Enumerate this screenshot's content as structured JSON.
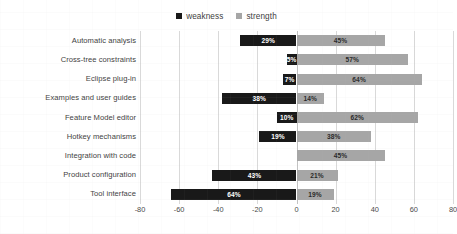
{
  "chart_data": {
    "type": "bar",
    "orientation": "horizontal",
    "subtype": "diverging-bar",
    "title": "",
    "xlabel": "",
    "ylabel": "",
    "xlim": [
      -80,
      80
    ],
    "xticks": [
      "-80",
      "-60",
      "-40",
      "-20",
      "0",
      "20",
      "40",
      "60",
      "80"
    ],
    "xtick_values": [
      -80,
      -60,
      -40,
      -20,
      0,
      20,
      40,
      60,
      80
    ],
    "grid": true,
    "grid_axis": "x",
    "legend_position": "top-center",
    "categories": [
      "Automatic analysis",
      "Cross-tree constraints",
      "Eclipse plug-in",
      "Examples and user guides",
      "Feature Model editor",
      "Hotkey mechanisms",
      "Integration with code",
      "Product configuration",
      "Tool interface"
    ],
    "series": [
      {
        "name": "weakness",
        "color": "#191919",
        "plotted_sign": "negative",
        "values": [
          -29,
          -5,
          -7,
          -38,
          -10,
          -19,
          0,
          -43,
          -64
        ],
        "labels": [
          "29%",
          "5%",
          "7%",
          "38%",
          "10%",
          "19%",
          "",
          "43%",
          "64%"
        ]
      },
      {
        "name": "strength",
        "color": "#a6a6a6",
        "plotted_sign": "positive",
        "values": [
          45,
          57,
          64,
          14,
          62,
          38,
          45,
          21,
          19
        ],
        "labels": [
          "45%",
          "57%",
          "64%",
          "14%",
          "62%",
          "38%",
          "45%",
          "21%",
          "19%"
        ]
      }
    ]
  },
  "legend": {
    "items": [
      {
        "label": "weakness",
        "color": "#191919"
      },
      {
        "label": "strength",
        "color": "#a6a6a6"
      }
    ]
  }
}
